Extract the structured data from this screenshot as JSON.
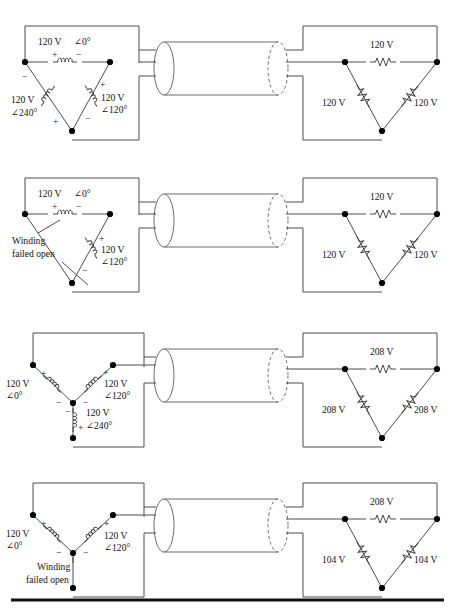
{
  "figure": {
    "panel_count": 4,
    "colors": {
      "wire": "#4d4d4d",
      "node": "#000000",
      "text": "#141414",
      "cable": "#6a6a6a",
      "rule": "#111111"
    },
    "symbols": {
      "coil": "inductor-winding-coil",
      "resistor": "zigzag-resistor",
      "node": "junction-dot",
      "cable": "three-conductor-cable",
      "plus": "+",
      "minus": "−",
      "angle": "∠",
      "degree": "°"
    }
  },
  "panels": [
    {
      "id": "panel-1",
      "source": {
        "type": "delta",
        "windings": [
          {
            "id": "top",
            "value": "120 V",
            "angle": "∠0°",
            "plus": "+",
            "minus": "−",
            "failed_open": false
          },
          {
            "id": "right",
            "value": "120 V",
            "angle": "∠120°",
            "plus": "+",
            "minus": "−",
            "failed_open": false
          },
          {
            "id": "left",
            "value": "120 V",
            "angle": "∠240°",
            "plus": "+",
            "minus": "−",
            "failed_open": false
          }
        ]
      },
      "load": {
        "type": "delta",
        "resistors": [
          {
            "id": "top",
            "value": "120 V"
          },
          {
            "id": "left",
            "value": "120 V"
          },
          {
            "id": "right",
            "value": "120 V"
          }
        ]
      }
    },
    {
      "id": "panel-2",
      "source": {
        "type": "delta",
        "fault_label_line1": "Winding",
        "fault_label_line2": "failed open",
        "windings": [
          {
            "id": "top",
            "value": "120 V",
            "angle": "∠0°",
            "plus": "+",
            "minus": "−",
            "failed_open": false
          },
          {
            "id": "right",
            "value": "120 V",
            "angle": "∠120°",
            "plus": "+",
            "minus": "−",
            "failed_open": false
          },
          {
            "id": "left",
            "value": "",
            "angle": "",
            "plus": "",
            "minus": "",
            "failed_open": true
          }
        ]
      },
      "load": {
        "type": "delta",
        "resistors": [
          {
            "id": "top",
            "value": "120 V"
          },
          {
            "id": "left",
            "value": "120 V"
          },
          {
            "id": "right",
            "value": "120 V"
          }
        ]
      }
    },
    {
      "id": "panel-3",
      "source": {
        "type": "wye",
        "windings": [
          {
            "id": "left",
            "value": "120 V",
            "angle": "∠0°",
            "plus": "+",
            "minus": "−",
            "failed_open": false
          },
          {
            "id": "right",
            "value": "120 V",
            "angle": "∠120°",
            "plus": "+",
            "minus": "−",
            "failed_open": false
          },
          {
            "id": "bottom",
            "value": "120 V",
            "angle": "∠240°",
            "plus": "+",
            "minus": "−",
            "failed_open": false
          }
        ]
      },
      "load": {
        "type": "delta",
        "resistors": [
          {
            "id": "top",
            "value": "208 V"
          },
          {
            "id": "left",
            "value": "208 V"
          },
          {
            "id": "right",
            "value": "208 V"
          }
        ]
      }
    },
    {
      "id": "panel-4",
      "source": {
        "type": "wye",
        "fault_label_line1": "Winding",
        "fault_label_line2": "failed open",
        "windings": [
          {
            "id": "left",
            "value": "120 V",
            "angle": "∠0°",
            "plus": "+",
            "minus": "−",
            "failed_open": false
          },
          {
            "id": "right",
            "value": "120 V",
            "angle": "∠120°",
            "plus": "+",
            "minus": "−",
            "failed_open": false
          },
          {
            "id": "bottom",
            "value": "",
            "angle": "",
            "plus": "",
            "minus": "",
            "failed_open": true
          }
        ]
      },
      "load": {
        "type": "delta",
        "resistors": [
          {
            "id": "top",
            "value": "208 V"
          },
          {
            "id": "left",
            "value": "104 V"
          },
          {
            "id": "right",
            "value": "104 V"
          }
        ]
      }
    }
  ]
}
